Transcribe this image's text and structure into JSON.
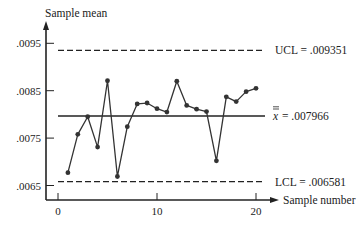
{
  "chart_data": {
    "type": "line",
    "title": "",
    "xlabel": "Sample number",
    "ylabel": "Sample mean",
    "x": [
      1,
      2,
      3,
      4,
      5,
      6,
      7,
      8,
      9,
      10,
      11,
      12,
      13,
      14,
      15,
      16,
      17,
      18,
      19,
      20
    ],
    "series": [
      {
        "name": "Sample mean",
        "values": [
          0.00677,
          0.00758,
          0.00795,
          0.00731,
          0.00871,
          0.00669,
          0.00774,
          0.00822,
          0.00824,
          0.00812,
          0.00805,
          0.0087,
          0.00819,
          0.00811,
          0.00806,
          0.00702,
          0.00837,
          0.00827,
          0.00848,
          0.00855
        ]
      }
    ],
    "reference_lines": [
      {
        "name": "UCL",
        "value": 0.009351,
        "label": "UCL = .009351",
        "style": "dashed"
      },
      {
        "name": "Center line",
        "value": 0.007966,
        "label": "x̿ = .007966",
        "style": "solid"
      },
      {
        "name": "LCL",
        "value": 0.006581,
        "label": "LCL = .006581",
        "style": "dashed"
      }
    ],
    "x_ticks": [
      0,
      10,
      20
    ],
    "x_tick_labels": [
      "0",
      "10",
      "20"
    ],
    "y_ticks": [
      0.0065,
      0.0075,
      0.0085,
      0.0095
    ],
    "y_tick_labels": [
      ".0065",
      ".0075",
      ".0085",
      ".0095"
    ],
    "xlim": [
      -1.2,
      22
    ],
    "ylim": [
      0.0062,
      0.0098
    ],
    "grid": false,
    "legend": "none"
  },
  "colors": {
    "line": "#333333",
    "axis": "#222222",
    "background": "#ffffff"
  }
}
